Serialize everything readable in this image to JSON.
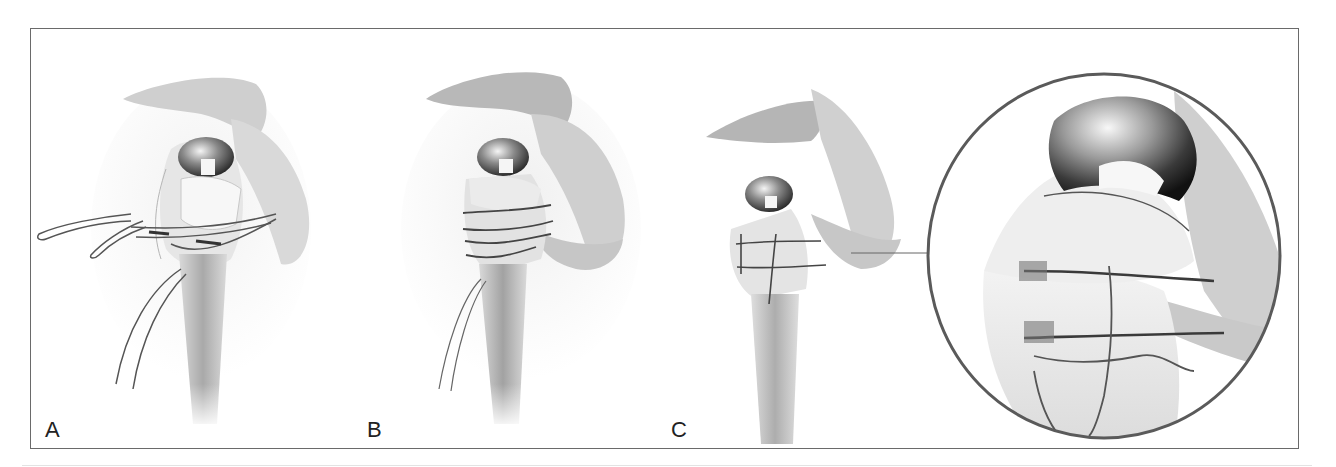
{
  "figure": {
    "panels": [
      {
        "id": "A",
        "label": "A",
        "description": "Humeral prosthesis with tuberosity sutures passed, loops untied"
      },
      {
        "id": "B",
        "label": "B",
        "description": "Sutures tied around tuberosities, cerclage in place"
      },
      {
        "id": "C",
        "label": "C",
        "description": "Completed tuberosity fixation with magnified detail inset"
      }
    ],
    "inset": {
      "label": "magnified-detail",
      "connects_to": "C"
    },
    "colors": {
      "frame": "#6a6a6a",
      "bone": "#d6d6d6",
      "bone_dark": "#9a9a9a",
      "metal": "#3a3a3a",
      "suture": "#4a4a4a",
      "inset_ring": "#5a5a5a"
    }
  }
}
